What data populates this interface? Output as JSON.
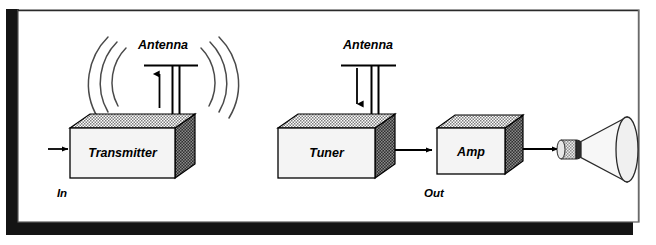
{
  "figure": {
    "background_color": "#ffffff",
    "frame": {
      "border_color": "#1a1a1a",
      "inner_fill": "#ffffff"
    }
  },
  "labels": {
    "antenna_transmit": "Antenna",
    "antenna_receive": "Antenna",
    "in": "In",
    "out": "Out"
  },
  "blocks": [
    {
      "id": "transmitter",
      "label": "Transmitter"
    },
    {
      "id": "tuner",
      "label": "Tuner"
    },
    {
      "id": "amp",
      "label": "Amp"
    }
  ],
  "icons": {
    "radio_waves_left": "radio-waves-left-icon",
    "radio_waves_right": "radio-waves-right-icon",
    "antenna_transmit": "antenna-transmit-icon",
    "antenna_receive": "antenna-receive-icon",
    "speaker": "horn-speaker-icon",
    "arrow_in": "arrow-right-icon",
    "arrow_tuner_to_amp": "arrow-right-icon",
    "arrow_amp_to_speaker": "arrow-right-icon",
    "arrow_up_transmit": "arrow-up-icon",
    "arrow_down_receive": "arrow-down-icon"
  },
  "colors": {
    "line": "#000000",
    "box_front": "#f2f2f2",
    "box_top_hatch": "#9a9a9a",
    "box_side_dark": "#3c3c3c",
    "wave": "#4a4a4a",
    "speaker_cone": "#f0f0f0",
    "speaker_ring": "#2b2b2b"
  }
}
